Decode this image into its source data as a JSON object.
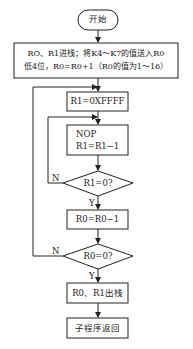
{
  "flowchart": {
    "start": "开始",
    "init_line1": "RO、R1进栈；将K4～K7的值送入R0",
    "init_line2": "低4位，R0=R0+1（R0的值为1～16）",
    "set_r1": "R1=0XFFFF",
    "nop_line1": "NOP",
    "nop_line2": "R1=R1−1",
    "decision1": "R1=0?",
    "dec_r0": "R0=R0−1",
    "decision2": "R0=0?",
    "pop": "R0、R1出栈",
    "return": "子程序返回",
    "yes_label": "Y",
    "no_label": "N"
  }
}
